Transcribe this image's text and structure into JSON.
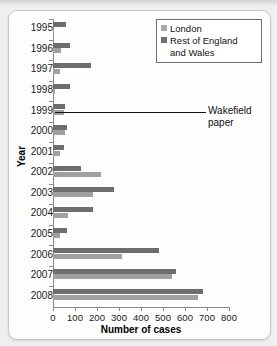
{
  "chart_data": {
    "type": "bar",
    "orientation": "horizontal",
    "title": "",
    "xlabel": "Number of cases",
    "ylabel": "Year",
    "xlim": [
      0,
      800
    ],
    "xticks": [
      0,
      100,
      200,
      300,
      400,
      500,
      600,
      700,
      800
    ],
    "grid": false,
    "legend_position": "top-right",
    "categories": [
      "1995",
      "1996",
      "1997",
      "1998",
      "1999",
      "2000",
      "2001",
      "2002",
      "2003",
      "2004",
      "2005",
      "2006",
      "2007",
      "2008"
    ],
    "series": [
      {
        "name": "London",
        "color": "#a0a0a0",
        "values": [
          4,
          35,
          32,
          8,
          50,
          55,
          30,
          218,
          180,
          68,
          32,
          315,
          540,
          660
        ]
      },
      {
        "name": "Rest of England and Wales",
        "color": "#6e6e6e",
        "values": [
          58,
          78,
          172,
          78,
          55,
          62,
          48,
          128,
          278,
          180,
          62,
          480,
          560,
          680
        ]
      }
    ],
    "annotations": [
      {
        "text": "Wakefield paper",
        "at_year_boundary": "1998/1999"
      }
    ]
  },
  "legend": {
    "items": [
      {
        "label": "London",
        "swatch": "light-gray-swatch"
      },
      {
        "label": "Rest of England",
        "label2": "and Wales",
        "swatch": "dark-gray-swatch"
      }
    ]
  },
  "annotation": {
    "line1": "Wakefield",
    "line2": "paper"
  },
  "axes": {
    "x_title": "Number of cases",
    "y_title": "Year"
  }
}
